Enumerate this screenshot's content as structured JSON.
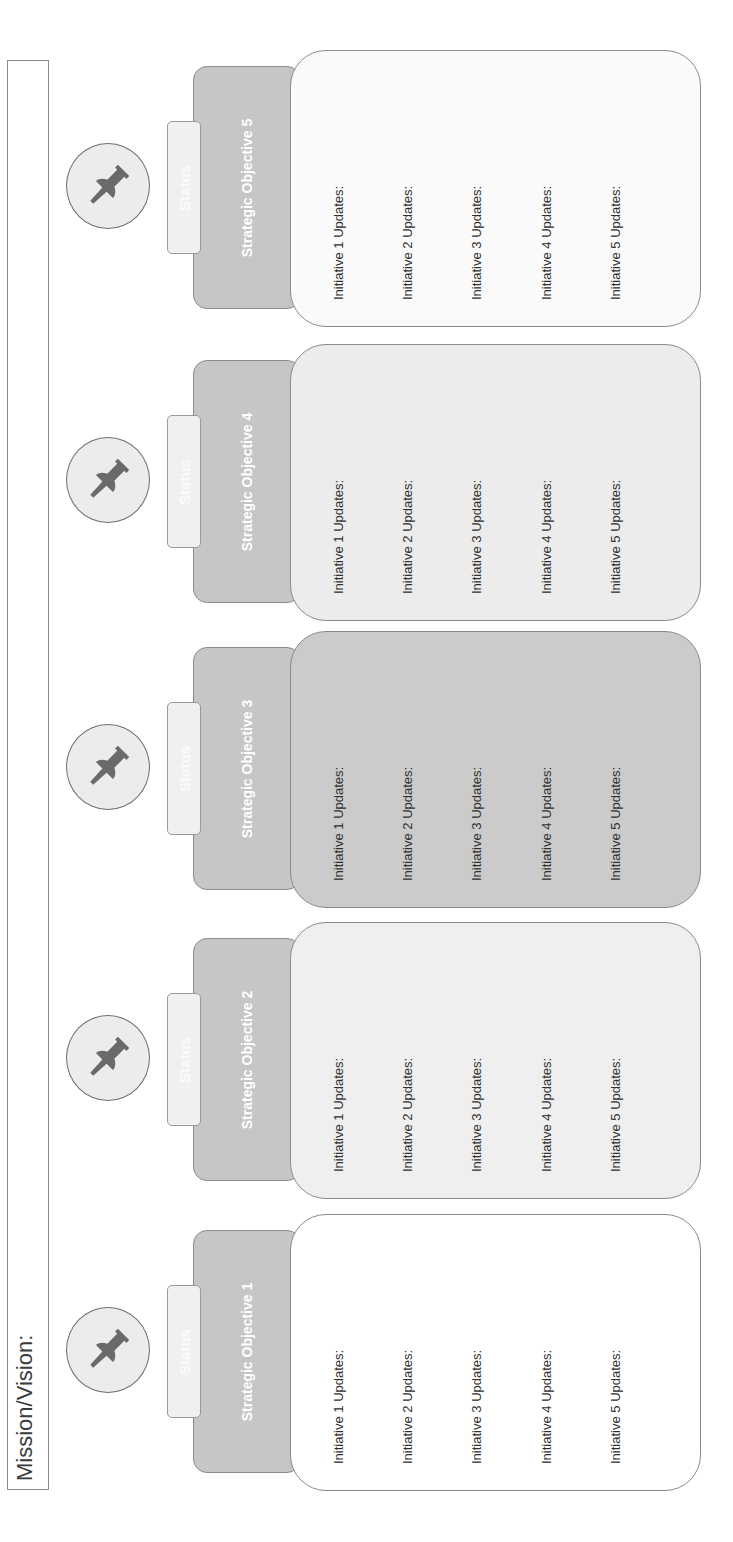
{
  "mission": {
    "label": "Mission/Vision:"
  },
  "colors": {
    "header_fill": "#c6c6c6",
    "status_fill": "#f0f0f0",
    "pin_fill": "#6a6a6a",
    "pin_circle_fill": "#ececec",
    "border": "#8a8a8a"
  },
  "objectives": [
    {
      "title": "Strategic Objective 1",
      "status_label": "Status",
      "icon": "pushpin-icon",
      "body_fill": "#ffffff",
      "initiatives": [
        "Initiative 1 Updates:",
        "Initiative 2 Updates:",
        "Initiative 3 Updates:",
        "Initiative 4 Updates:",
        "Initiative 5 Updates:"
      ]
    },
    {
      "title": "Strategic Objective 2",
      "status_label": "Status",
      "icon": "pushpin-icon",
      "body_fill": "#efefef",
      "initiatives": [
        "Initiative 1 Updates:",
        "Initiative 2 Updates:",
        "Initiative 3 Updates:",
        "Initiative 4 Updates:",
        "Initiative 5 Updates:"
      ]
    },
    {
      "title": "Strategic Objective 3",
      "status_label": "Status",
      "icon": "pushpin-icon",
      "body_fill": "#cbcbcb",
      "initiatives": [
        "Initiative 1 Updates:",
        "Initiative 2 Updates:",
        "Initiative 3 Updates:",
        "Initiative 4 Updates:",
        "Initiative 5 Updates:"
      ]
    },
    {
      "title": "Strategic Objective 4",
      "status_label": "Status",
      "icon": "pushpin-icon",
      "body_fill": "#ececec",
      "initiatives": [
        "Initiative 1 Updates:",
        "Initiative 2 Updates:",
        "Initiative 3 Updates:",
        "Initiative 4 Updates:",
        "Initiative 5 Updates:"
      ]
    },
    {
      "title": "Strategic Objective 5",
      "status_label": "Status",
      "icon": "pushpin-icon",
      "body_fill": "#fafafa",
      "initiatives": [
        "Initiative 1 Updates:",
        "Initiative 2 Updates:",
        "Initiative 3 Updates:",
        "Initiative 4 Updates:",
        "Initiative 5 Updates:"
      ]
    }
  ]
}
